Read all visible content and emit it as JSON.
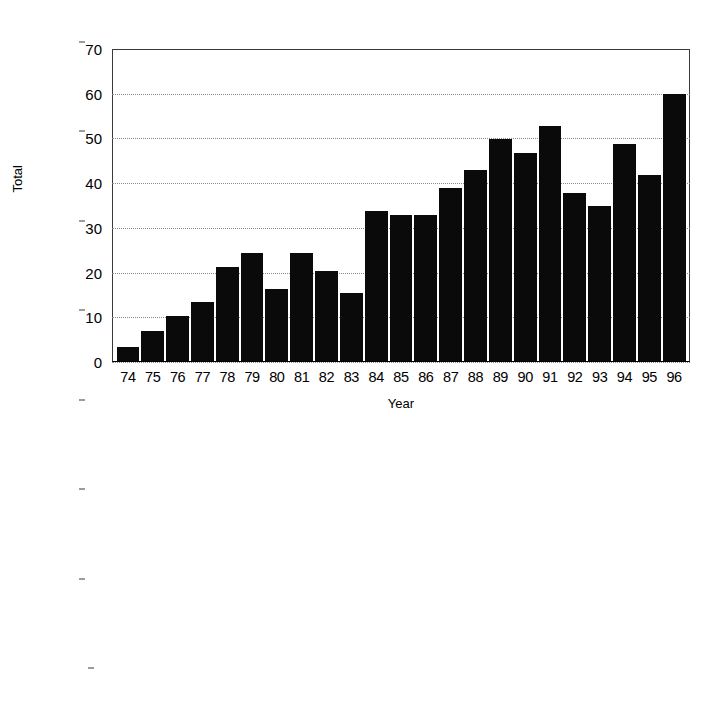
{
  "chart_data": [
    {
      "id": "chart-top",
      "type": "bar",
      "title": "",
      "xlabel": "Year",
      "ylabel": "Total",
      "ylim": [
        0,
        70
      ],
      "yticks": [
        0,
        10,
        20,
        30,
        40,
        50,
        60,
        70
      ],
      "grid": true,
      "legend": "none",
      "bar_color": "#0a0a0a",
      "categories": [
        "74",
        "75",
        "76",
        "77",
        "78",
        "79",
        "80",
        "81",
        "82",
        "83",
        "84",
        "85",
        "86",
        "87",
        "88",
        "89",
        "90",
        "91",
        "92",
        "93",
        "94",
        "95",
        "96"
      ],
      "values": [
        3,
        6.5,
        10,
        13,
        21,
        24,
        16,
        24,
        20,
        15,
        33.5,
        32.5,
        32.5,
        38.5,
        42.5,
        49.5,
        46.5,
        52.5,
        37.5,
        34.5,
        48.5,
        41.5,
        59.5
      ]
    },
    {
      "id": "chart-bottom",
      "type": "bar",
      "title": "",
      "xlabel": "",
      "ylabel": "Total",
      "ylim": [
        0,
        70
      ],
      "yticks": [
        20,
        30,
        40,
        50,
        60,
        70
      ],
      "grid": true,
      "legend": "none",
      "bar_color": "#0a0a0a",
      "note": "bottom of plot is cropped by the image edge",
      "categories": [
        "74",
        "75",
        "76",
        "77",
        "78",
        "79",
        "80",
        "81",
        "82",
        "83",
        "84",
        "85",
        "86",
        "87",
        "88",
        "89",
        "90",
        "91",
        "92",
        "93",
        "94",
        "95",
        "96"
      ],
      "values": [
        0,
        0,
        14.5,
        0,
        0,
        0,
        14,
        17.5,
        24.5,
        22.5,
        26.5,
        29.5,
        29.5,
        37.5,
        43,
        52,
        47.5,
        38.5,
        45,
        55,
        60.5,
        0,
        0
      ]
    }
  ],
  "figures": [
    {
      "ylabel": "Total",
      "xlabel": "Year",
      "ytick_labels": [
        "70",
        "60",
        "50",
        "40",
        "30",
        "20",
        "10",
        "0"
      ],
      "xtick_labels": [
        "74",
        "75",
        "76",
        "77",
        "78",
        "79",
        "80",
        "81",
        "82",
        "83",
        "84",
        "85",
        "86",
        "87",
        "88",
        "89",
        "90",
        "91",
        "92",
        "93",
        "94",
        "95",
        "96"
      ]
    },
    {
      "ylabel": "Total",
      "xlabel": "",
      "ytick_labels": [
        "70",
        "60",
        "50",
        "40",
        "30",
        "20"
      ],
      "xtick_labels": []
    }
  ]
}
